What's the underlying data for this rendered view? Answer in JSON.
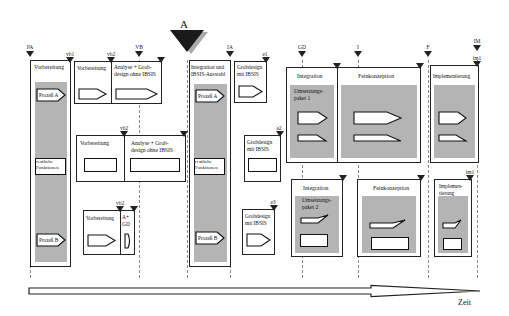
{
  "milestones_top": [
    {
      "label": "PA",
      "x": 30
    },
    {
      "label": "VB",
      "x": 139
    },
    {
      "label": "IA",
      "x": 230
    },
    {
      "label": "GD",
      "x": 302
    },
    {
      "label": "I",
      "x": 358
    },
    {
      "label": "F",
      "x": 428
    },
    {
      "label": "IM",
      "x": 477
    }
  ],
  "milestone_big": {
    "label": "A",
    "x": 187
  },
  "sub_milestones": {
    "vb1": "vb1",
    "vb2a": "vb2",
    "vb2b": "vb2",
    "vb2c": "vb2",
    "e1": "e1",
    "e2": "e2",
    "e3": "e3",
    "imb1": "im1",
    "imb2": "im1"
  },
  "column1": {
    "title": "Vorbereitung",
    "process_a": "Prozeß A",
    "rest": "restliche Funktionen",
    "process_b": "Prozeß B"
  },
  "row1": {
    "prep": "Vorbereitung",
    "analysis": "Analyse + Grob-design ohne IBSIS"
  },
  "row2": {
    "prep": "Vorbereitung",
    "analysis": "Analyse + Grob-design ohne IBSIS"
  },
  "row3": {
    "prep": "Vorbereitung",
    "agd": "A+ GD"
  },
  "column_integration": {
    "title": "Integration und IBSIS-Auswahl",
    "process_a": "Prozeß A",
    "rest": "restliche Funktionen",
    "process_b": "Prozeß B"
  },
  "grobdesign": {
    "g1": "Grobdesign mit IBSIS",
    "g2": "Grobdesign mit IBSIS",
    "g3": "Grobdesign mit IBSIS"
  },
  "package1": {
    "integration": "Integration",
    "package_label": "Umsetzungs-paket 1",
    "feinkonzeption": "Feinkonzeption",
    "implementation": "Implementierung"
  },
  "package2": {
    "integration": "Integration",
    "package_label": "Umsetzungs-paket 2",
    "feinkonzeption": "Feinkonzeption",
    "implementation": "Implemen-tierung"
  },
  "timeline": {
    "label": "Zeit"
  }
}
